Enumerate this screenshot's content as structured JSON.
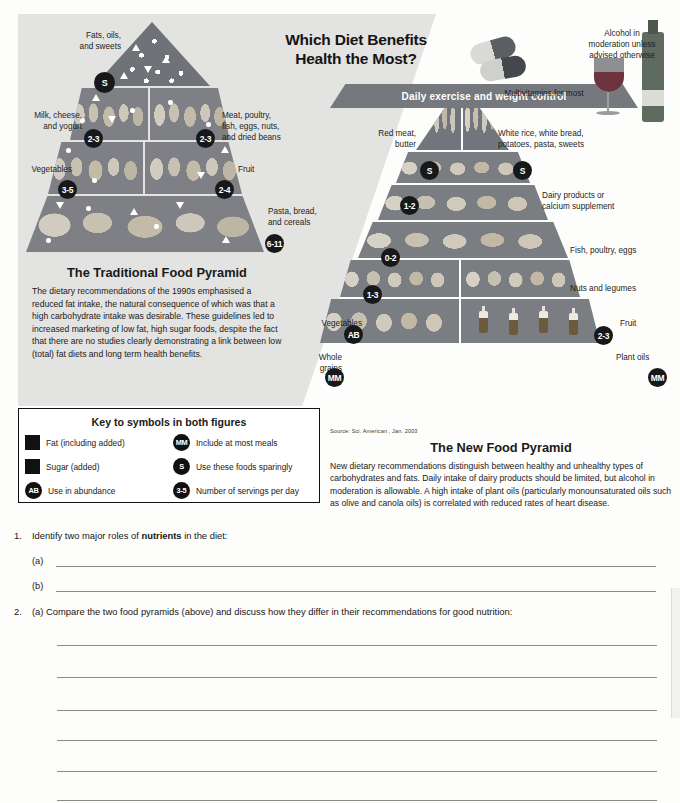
{
  "headline": "Which Diet Benefits\nHealth the Most?",
  "headline_line1": "Which Diet Benefits",
  "headline_line2": "Health the Most?",
  "traditional": {
    "title": "The Traditional Food Pyramid",
    "body": "The dietary recommendations of the 1990s emphasised a reduced fat intake, the natural consequence of which was that a high carbohydrate intake was desirable. These guidelines led to increased marketing of low fat, high sugar foods, despite the fact that there are no studies clearly demonstrating a link between low (total) fat diets and long term health benefits.",
    "tiers": [
      {
        "label": "Fats, oils,\nand sweets",
        "label_l1": "Fats, oils,",
        "label_l2": "and sweets",
        "badge": "S"
      },
      {
        "label": "Milk, cheese,\nand yogurt",
        "label_l1": "Milk, cheese,",
        "label_l2": "and yogurt",
        "badge": "2-3"
      },
      {
        "label": "Meat, poultry,\nfish, eggs, nuts,\nand dried beans",
        "label_l1": "Meat, poultry,",
        "label_l2": "fish, eggs, nuts,",
        "label_l3": "and dried beans",
        "badge": "2-3"
      },
      {
        "label": "Vegetables",
        "badge": "3-5"
      },
      {
        "label": "Fruit",
        "badge": "2-4"
      },
      {
        "label": "Pasta, bread,\nand cereals",
        "label_l1": "Pasta, bread,",
        "label_l2": "and cereals",
        "badge": "6-11"
      }
    ]
  },
  "newpyramid": {
    "title": "The New Food Pyramid",
    "body": "New dietary recommendations distinguish between healthy and unhealthy types of carbohydrates and fats. Daily intake of dairy products should be limited, but alcohol in moderation is allowable. A high intake of plant oils (particularly monounsaturated oils such as olive and canola oils) is correlated with reduced rates of heart disease.",
    "source": "Source: Sci. American , Jan. 2003",
    "alcohol_l1": "Alcohol in",
    "alcohol_l2": "moderation unless",
    "alcohol_l3": "advised otherwise",
    "multivitamins": "Multivitamins for most",
    "base_label": "Daily exercise and weight control",
    "tiers": [
      {
        "label_l1": "Red meat,",
        "label_l2": "butter",
        "badge": "S"
      },
      {
        "label_l1": "White rice, white bread,",
        "label_l2": "potatoes, pasta, sweets",
        "badge": "S"
      },
      {
        "label_l1": "Dairy products or",
        "label_l2": "calcium supplement",
        "badge": "1-2"
      },
      {
        "label_l1": "Fish, poultry, eggs",
        "badge": "0-2"
      },
      {
        "label_l1": "Nuts and legumes",
        "badge": "1-3"
      },
      {
        "label_l1": "Vegetables",
        "badge": "AB"
      },
      {
        "label_l1": "Fruit",
        "badge": "2-3"
      },
      {
        "label_l1": "Whole",
        "label_l2": "grains",
        "badge": "MM"
      },
      {
        "label_l1": "Plant oils",
        "badge": "MM"
      }
    ]
  },
  "key": {
    "title": "Key to symbols in both figures",
    "items": [
      {
        "symbol": "fat-dot",
        "badge": "",
        "label": "Fat (including added)"
      },
      {
        "symbol": "mm-circle",
        "badge": "MM",
        "label": "Include at most meals"
      },
      {
        "symbol": "sugar-triangle",
        "badge": "",
        "label": "Sugar (added)"
      },
      {
        "symbol": "s-circle",
        "badge": "S",
        "label": "Use these foods sparingly"
      },
      {
        "symbol": "ab-circle",
        "badge": "AB",
        "label": "Use in abundance"
      },
      {
        "symbol": "servings-circle",
        "badge": "3-5",
        "label": "Number of servings per day"
      }
    ]
  },
  "worksheet": {
    "q1_number": "1.",
    "q1_pre": "Identify two major roles of ",
    "q1_bold": "nutrients",
    "q1_post": " in the diet:",
    "q1a": "(a)",
    "q1b": "(b)",
    "q2_number": "2.",
    "q2_text": "(a) Compare the two food pyramids (above) and discuss how they differ in their recommendations for good nutrition:",
    "answer_lines": 6
  },
  "colors": {
    "panel_grey": "#e3e3e1",
    "pyramid_grey": "#7e8186",
    "badge_black": "#17181a",
    "page_bg": "#fdfdfc"
  }
}
